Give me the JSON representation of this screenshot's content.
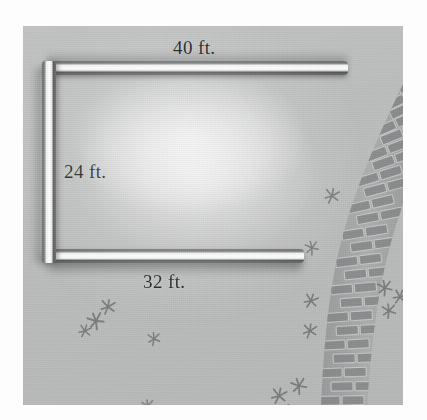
{
  "figure": {
    "kind": "geometry-illustration",
    "background_color": "#bcbdbd",
    "wall_color": "#ffffff",
    "wall_shadow_color": "#5a5b5b",
    "brick_color": "#9a9b9b",
    "grass_color": "#6b6c6c",
    "label_color": "#191919"
  },
  "dimensions": {
    "top": "40 ft.",
    "left": "24 ft.",
    "bottom": "32 ft."
  },
  "elements": {
    "wall_top_name": "fence-top-section",
    "wall_left_name": "fence-left-section",
    "wall_bottom_name": "fence-bottom-section",
    "lawn_name": "interior-lawn",
    "path_name": "brick-walkway",
    "grass_name": "grass-sprigs"
  },
  "brick_path": {
    "orientation": "curving from upper-right down to lower-left",
    "row_count": 22
  },
  "grass_sprigs": [
    {
      "x": 309,
      "y": 170,
      "size": 13,
      "rot": 10
    },
    {
      "x": 289,
      "y": 222,
      "size": 12,
      "rot": -15
    },
    {
      "x": 85,
      "y": 281,
      "size": 13,
      "rot": 8
    },
    {
      "x": 73,
      "y": 295,
      "size": 14,
      "rot": -22
    },
    {
      "x": 62,
      "y": 305,
      "size": 11,
      "rot": 14
    },
    {
      "x": 131,
      "y": 313,
      "size": 11,
      "rot": -5
    },
    {
      "x": 288,
      "y": 275,
      "size": 12,
      "rot": 18
    },
    {
      "x": 362,
      "y": 262,
      "size": 13,
      "rot": -12
    },
    {
      "x": 377,
      "y": 271,
      "size": 12,
      "rot": 20
    },
    {
      "x": 366,
      "y": 285,
      "size": 12,
      "rot": -8
    },
    {
      "x": 287,
      "y": 305,
      "size": 12,
      "rot": 6
    },
    {
      "x": 276,
      "y": 360,
      "size": 13,
      "rot": -18
    },
    {
      "x": 256,
      "y": 370,
      "size": 13,
      "rot": 12
    },
    {
      "x": 268,
      "y": 385,
      "size": 11,
      "rot": 28
    },
    {
      "x": 125,
      "y": 380,
      "size": 11,
      "rot": -10
    }
  ]
}
